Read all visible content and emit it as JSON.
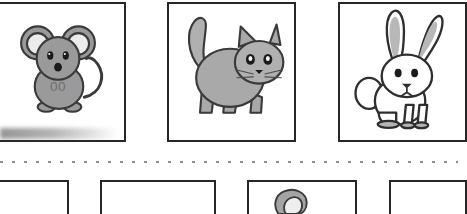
{
  "page": {
    "kind": "worksheet",
    "background_color": "#ffffff",
    "frame_color": "#272727",
    "cut_line": {
      "name": "dotted-cut-line",
      "color": "#8d8d8d",
      "style": "dotted",
      "y": 160
    }
  },
  "top_row": {
    "label": "animal-picture-row",
    "cards": [
      {
        "id": "card-mouse",
        "animal": "mouse",
        "alt": "grey cartoon mouse with big round ears, curly tail and 00 belly marking",
        "icon": "mouse-icon",
        "body_color": "#9a9a9a",
        "ear_inner_color": "#e9e9e9",
        "outline_color": "#3a3a3a",
        "belly_text": "00"
      },
      {
        "id": "card-cat",
        "animal": "cat",
        "alt": "grey cartoon cat standing in profile with raised tail, pointed ears and whiskers",
        "icon": "cat-icon",
        "body_color": "#a9a9a9",
        "ear_inner_color": "#e9e9e9",
        "outline_color": "#3a3a3a"
      },
      {
        "id": "card-rabbit",
        "animal": "rabbit",
        "alt": "white cartoon rabbit sitting with long upright ears and round tail",
        "icon": "rabbit-icon",
        "body_color": "#ffffff",
        "ear_inner_color": "#b8b8b8",
        "outline_color": "#2e2e2e"
      }
    ]
  },
  "bottom_row": {
    "label": "answer-box-row",
    "note": "row is cropped by the bottom edge of the screenshot",
    "boxes": [
      {
        "id": "box-1",
        "content": "",
        "cropped_left": true
      },
      {
        "id": "box-2",
        "content": ""
      },
      {
        "id": "box-3",
        "content": "partial-grey-object",
        "icon": "grey-blob-icon"
      },
      {
        "id": "box-4",
        "content": "",
        "cropped_right": true
      }
    ]
  }
}
